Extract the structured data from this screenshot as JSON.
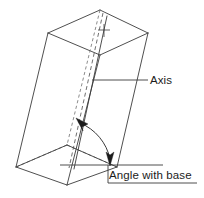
{
  "figure": {
    "kind": "geometry-diagram",
    "background_color": "#ffffff",
    "line_color": "#3b3b3b",
    "hidden_line_color": "#6e6e6e",
    "arrow_color": "#1c1c1c",
    "text_color": "#1c1c1c"
  },
  "labels": {
    "axis": "Axis",
    "angle_with_base": "Angle with base"
  },
  "annotations": {
    "axis_leader": {
      "from_x": 92,
      "from_y": 80,
      "to_x": 148,
      "to_y": 80
    },
    "angle_underline": {
      "from_x": 108,
      "from_y": 183,
      "to_x": 197,
      "to_y": 183
    },
    "base_reference_line": {
      "from_x": 60,
      "from_y": 165,
      "to_x": 163,
      "to_y": 165
    }
  },
  "geometry": {
    "top_face": {
      "back": [
        100,
        10
      ],
      "left": [
        48,
        33
      ],
      "front": [
        100,
        55
      ],
      "right": [
        148,
        33
      ]
    },
    "bottom_face": {
      "back": [
        67,
        145
      ],
      "left": [
        16,
        167
      ],
      "front": [
        67,
        185
      ],
      "right": [
        117,
        167
      ]
    },
    "axis": {
      "top": [
        100,
        13
      ],
      "bottom": [
        67,
        168
      ]
    },
    "center_mark_top": [
      103,
      30
    ],
    "angle_arc": {
      "start": [
        79,
        122
      ],
      "end": [
        110,
        160
      ],
      "radius": 52
    }
  }
}
